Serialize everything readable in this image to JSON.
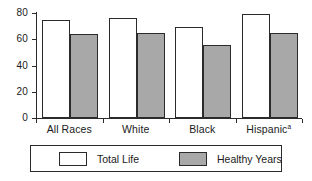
{
  "chart_data": {
    "type": "bar",
    "title": "",
    "xlabel": "",
    "ylabel": "",
    "ylim": [
      0,
      80
    ],
    "yticks": [
      0,
      20,
      40,
      60,
      80
    ],
    "grid": false,
    "legend_position": "bottom",
    "categories": [
      "All Races",
      "White",
      "Black",
      "Hispanic"
    ],
    "category_notes": [
      "",
      "",
      "",
      "a"
    ],
    "series": [
      {
        "name": "Total Life",
        "color": "#ffffff",
        "values": [
          75,
          76,
          69,
          79
        ]
      },
      {
        "name": "Healthy Years",
        "color": "#a8a8a8",
        "values": [
          64,
          65,
          56,
          65
        ]
      }
    ]
  },
  "axis": {
    "ticks": [
      {
        "label": "80",
        "value": 80
      },
      {
        "label": "60",
        "value": 60
      },
      {
        "label": "40",
        "value": 40
      },
      {
        "label": "20",
        "value": 20
      },
      {
        "label": "0",
        "value": 0
      }
    ]
  },
  "legend": {
    "entries": [
      {
        "label": "Total Life",
        "color": "#ffffff"
      },
      {
        "label": "Healthy Years",
        "color": "#a8a8a8"
      }
    ]
  },
  "colors": {
    "axis": "#2b2b2b",
    "total_life_fill": "#ffffff",
    "healthy_years_fill": "#a8a8a8",
    "text": "#1a1a1a",
    "background": "#ffffff"
  }
}
